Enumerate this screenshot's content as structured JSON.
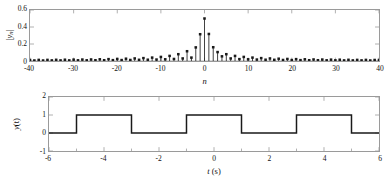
{
  "figure": {
    "kind": "two-panel-signal-figure",
    "background": "#ffffff",
    "axis_color": "#9a9a9a",
    "data_color": "#1a1a1a"
  },
  "chart_data": [
    {
      "type": "bar",
      "name": "fourier-magnitude-spectrum",
      "title": "",
      "xlabel": "n",
      "ylabel": "|y_n|",
      "ylabel_parts": {
        "base": "y",
        "sub": "n",
        "bars": "|"
      },
      "xlim": [
        -40,
        40
      ],
      "ylim": [
        0,
        0.6
      ],
      "xticks": [
        -40,
        -30,
        -20,
        -10,
        0,
        10,
        20,
        30,
        40
      ],
      "xticklabels": [
        "-40",
        "-30",
        "-20",
        "-10",
        "0",
        "10",
        "20",
        "30",
        "40"
      ],
      "yticks": [
        0,
        0.2,
        0.4,
        0.6
      ],
      "yticklabels": [
        "0",
        "0.2",
        "0.4",
        "0.6"
      ],
      "minor_xticks_interval": 10,
      "grid": false,
      "legend": null,
      "marker": "filled-square-stem",
      "categories": [
        -40,
        -39,
        -38,
        -37,
        -36,
        -35,
        -34,
        -33,
        -32,
        -31,
        -30,
        -29,
        -28,
        -27,
        -26,
        -25,
        -24,
        -23,
        -22,
        -21,
        -20,
        -19,
        -18,
        -17,
        -16,
        -15,
        -14,
        -13,
        -12,
        -11,
        -10,
        -9,
        -8,
        -7,
        -6,
        -5,
        -4,
        -3,
        -2,
        -1,
        0,
        1,
        2,
        3,
        4,
        5,
        6,
        7,
        8,
        9,
        10,
        11,
        12,
        13,
        14,
        15,
        16,
        17,
        18,
        19,
        20,
        21,
        22,
        23,
        24,
        25,
        26,
        27,
        28,
        29,
        30,
        31,
        32,
        33,
        34,
        35,
        36,
        37,
        38,
        39,
        40
      ],
      "values": [
        0.012,
        0.006,
        0.013,
        0.006,
        0.013,
        0.007,
        0.014,
        0.007,
        0.015,
        0.007,
        0.016,
        0.008,
        0.017,
        0.008,
        0.018,
        0.009,
        0.02,
        0.009,
        0.022,
        0.01,
        0.024,
        0.011,
        0.027,
        0.012,
        0.03,
        0.014,
        0.034,
        0.015,
        0.04,
        0.017,
        0.048,
        0.02,
        0.06,
        0.024,
        0.08,
        0.03,
        0.115,
        0.04,
        0.16,
        0.315,
        0.5,
        0.318,
        0.162,
        0.105,
        0.055,
        0.08,
        0.03,
        0.06,
        0.022,
        0.048,
        0.02,
        0.04,
        0.017,
        0.034,
        0.015,
        0.03,
        0.014,
        0.027,
        0.012,
        0.024,
        0.011,
        0.022,
        0.01,
        0.02,
        0.009,
        0.018,
        0.009,
        0.017,
        0.008,
        0.016,
        0.008,
        0.015,
        0.007,
        0.014,
        0.007,
        0.013,
        0.007,
        0.013,
        0.006,
        0.012,
        0.012
      ]
    },
    {
      "type": "line",
      "name": "time-domain-square-wave",
      "title": "",
      "xlabel": "t (s)",
      "xlabel_parts": {
        "symbol": "t",
        "unit": "(s)"
      },
      "ylabel": "y(t)",
      "ylabel_parts": {
        "base": "y",
        "arg": "(t)"
      },
      "xlim": [
        -6,
        6
      ],
      "ylim": [
        -1,
        2
      ],
      "xticks": [
        -6,
        -4,
        -2,
        0,
        2,
        4,
        6
      ],
      "xticklabels": [
        "-6",
        "-4",
        "-2",
        "0",
        "2",
        "4",
        "6"
      ],
      "yticks": [
        -1,
        0,
        1,
        2
      ],
      "yticklabels": [
        "-1",
        "0",
        "1",
        "2"
      ],
      "minor_xticks_interval": 1,
      "grid": false,
      "legend": null,
      "waveform": "square-pulse-train",
      "high_level": 1,
      "low_level": 0,
      "period": 4,
      "duty_cycle": 0.5,
      "transitions": [
        -5,
        -3,
        -1,
        1,
        3,
        5
      ],
      "x": [
        -6,
        -5,
        -5,
        -3,
        -3,
        -1,
        -1,
        1,
        1,
        3,
        3,
        5,
        5,
        6
      ],
      "y": [
        0,
        0,
        1,
        1,
        0,
        0,
        1,
        1,
        0,
        0,
        1,
        1,
        0,
        0
      ]
    }
  ]
}
